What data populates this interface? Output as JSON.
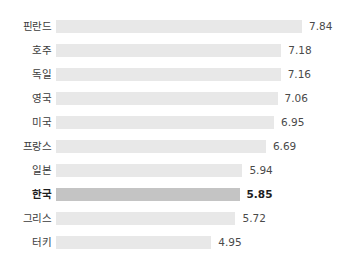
{
  "chart_data": {
    "type": "bar",
    "orientation": "horizontal",
    "title": "",
    "subtitle": "",
    "xlabel": "",
    "ylabel": "",
    "grid": false,
    "legend": null,
    "axis_visible": false,
    "xlim": [
      0,
      7.84
    ],
    "categories": [
      "핀란드",
      "호주",
      "독일",
      "영국",
      "미국",
      "프랑스",
      "일본",
      "한국",
      "그리스",
      "터키"
    ],
    "values": [
      7.84,
      7.18,
      7.16,
      7.06,
      6.95,
      6.69,
      5.94,
      5.85,
      5.72,
      4.95
    ],
    "value_labels": [
      "7.84",
      "7.18",
      "7.16",
      "7.06",
      "6.95",
      "6.69",
      "5.94",
      "5.85",
      "5.72",
      "4.95"
    ],
    "highlight_index": 7,
    "colors": {
      "bar": "#e8e8e8",
      "bar_highlight": "#c4c4c4",
      "label": "#3c3c3c",
      "label_highlight": "#1d1d1d",
      "value": "#4a4a4a",
      "value_highlight": "#1d1d1d",
      "background": "#ffffff"
    },
    "rows": [
      {
        "label": "핀란드",
        "value": 7.84,
        "value_label": "7.84",
        "highlight": false
      },
      {
        "label": "호주",
        "value": 7.18,
        "value_label": "7.18",
        "highlight": false
      },
      {
        "label": "독일",
        "value": 7.16,
        "value_label": "7.16",
        "highlight": false
      },
      {
        "label": "영국",
        "value": 7.06,
        "value_label": "7.06",
        "highlight": false
      },
      {
        "label": "미국",
        "value": 6.95,
        "value_label": "6.95",
        "highlight": false
      },
      {
        "label": "프랑스",
        "value": 6.69,
        "value_label": "6.69",
        "highlight": false
      },
      {
        "label": "일본",
        "value": 5.94,
        "value_label": "5.94",
        "highlight": false
      },
      {
        "label": "한국",
        "value": 5.85,
        "value_label": "5.85",
        "highlight": true
      },
      {
        "label": "그리스",
        "value": 5.72,
        "value_label": "5.72",
        "highlight": false
      },
      {
        "label": "터키",
        "value": 4.95,
        "value_label": "4.95",
        "highlight": false
      }
    ]
  }
}
